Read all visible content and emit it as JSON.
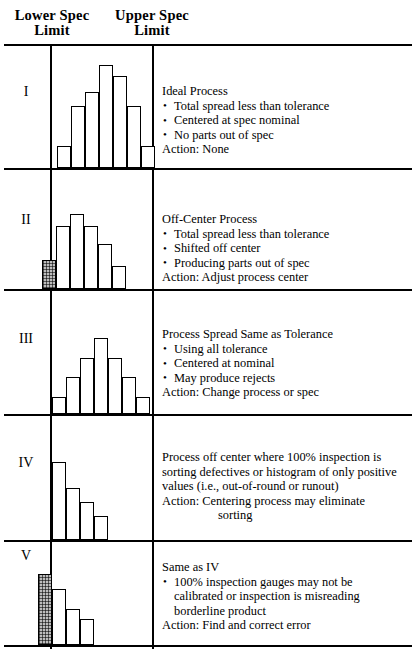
{
  "header": {
    "lower_spec_label": "Lower Spec\nLimit",
    "lower_spec_line1": "Lower Spec",
    "lower_spec_line2": "Limit",
    "upper_spec_line1": "Upper Spec",
    "upper_spec_line2": "Limit"
  },
  "colors": {
    "line": "#000000",
    "bar_fill": "#ffffff",
    "bar_shaded": "#bdbdbd",
    "background": "#ffffff"
  },
  "rows": [
    {
      "numeral": "I",
      "title": "Ideal Process",
      "bullets": [
        "Total spread less than tolerance",
        "Centered at spec nominal",
        "No parts out of spec"
      ],
      "action": "Action:  None",
      "action_cont": ""
    },
    {
      "numeral": "II",
      "title": "Off-Center Process",
      "bullets": [
        "Total spread less than tolerance",
        "Shifted off center",
        "Producing parts out of spec"
      ],
      "action": "Action:  Adjust process center",
      "action_cont": ""
    },
    {
      "numeral": "III",
      "title": "Process Spread Same as Tolerance",
      "bullets": [
        "Using all tolerance",
        "Centered at nominal",
        "May produce rejects"
      ],
      "action": "Action:  Change process or spec",
      "action_cont": ""
    },
    {
      "numeral": "IV",
      "title": "Process off center where 100% inspection is",
      "title_line2": "sorting defectives or histogram of only positive",
      "title_line3": "values (i.e., out-of-round or runout)",
      "bullets": [],
      "action": "Action:  Centering process may eliminate",
      "action_cont": "sorting"
    },
    {
      "numeral": "V",
      "title": "Same as IV",
      "bullets": [
        "100% inspection gauges may not be"
      ],
      "bullet_cont1": "calibrated or inspection is misreading",
      "bullet_cont2": "borderline product",
      "action": "Action:  Find and correct error",
      "action_cont": ""
    }
  ],
  "chart_data": [
    {
      "type": "bar",
      "title": "Ideal Process histogram",
      "categories": [
        "1",
        "2",
        "3",
        "4",
        "5",
        "6",
        "7"
      ],
      "values": [
        22,
        62,
        76,
        103,
        92,
        62,
        22
      ],
      "bar_width": 14,
      "x_start": 57,
      "shaded_index": -1,
      "lower_spec_x": 51,
      "upper_spec_x": 153,
      "ylabel": "",
      "xlabel": "",
      "grid": false
    },
    {
      "type": "bar",
      "title": "Off-Center Process histogram",
      "categories": [
        "1",
        "2",
        "3",
        "4",
        "5",
        "6"
      ],
      "values": [
        29,
        63,
        75,
        63,
        45,
        23
      ],
      "bar_width": 14,
      "x_start": 42,
      "shaded_index": 0,
      "lower_spec_x": 51,
      "upper_spec_x": 153,
      "ylabel": "",
      "xlabel": "",
      "grid": false
    },
    {
      "type": "bar",
      "title": "Process Spread Same as Tolerance histogram",
      "categories": [
        "1",
        "2",
        "3",
        "4",
        "5",
        "6",
        "7"
      ],
      "values": [
        17,
        37,
        56,
        76,
        56,
        37,
        17
      ],
      "bar_width": 14,
      "x_start": 52,
      "shaded_index": -1,
      "lower_spec_x": 51,
      "upper_spec_x": 153,
      "ylabel": "",
      "xlabel": "",
      "grid": false
    },
    {
      "type": "bar",
      "title": "Process off center histogram",
      "categories": [
        "1",
        "2",
        "3",
        "4"
      ],
      "values": [
        78,
        52,
        38,
        24
      ],
      "bar_width": 14,
      "x_start": 52,
      "shaded_index": -1,
      "lower_spec_x": 51,
      "upper_spec_x": 153,
      "ylabel": "",
      "xlabel": "",
      "grid": false
    },
    {
      "type": "bar",
      "title": "Same as IV histogram",
      "categories": [
        "1",
        "2",
        "3",
        "4"
      ],
      "values": [
        71,
        56,
        36,
        26
      ],
      "bar_width": 14,
      "x_start": 38,
      "shaded_index": 0,
      "lower_spec_x": 51,
      "upper_spec_x": 153,
      "ylabel": "",
      "xlabel": "",
      "grid": false
    }
  ]
}
